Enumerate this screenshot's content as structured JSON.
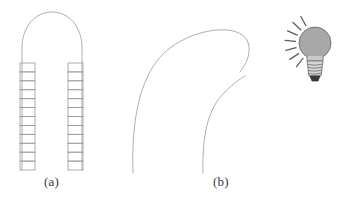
{
  "figure": {
    "background_color": "#ffffff",
    "line_color": "#9a9a9a",
    "line_width": 0.8,
    "captions": [
      {
        "id": "a",
        "label": "(a)",
        "x": 44,
        "y": 174
      },
      {
        "id": "b",
        "label": "(b)",
        "x": 213,
        "y": 174
      }
    ],
    "panels": [
      {
        "id": "panel-a",
        "caption": "(a)",
        "name": "straight-arch-with-ladder-rungs",
        "arch": {
          "name": "arch-outline",
          "left_x": 22,
          "right_x": 82,
          "top_y": 12,
          "bottom_y": 170,
          "shoulder_y": 48,
          "stroke": "#9a9a9a"
        },
        "rung_columns": [
          {
            "name": "left-rung-column",
            "x": 20,
            "width": 15,
            "top_y": 63,
            "bottom_y": 170,
            "segments": 12,
            "stroke": "#9a9a9a"
          },
          {
            "name": "right-rung-column",
            "x": 68,
            "width": 15,
            "top_y": 63,
            "bottom_y": 170,
            "segments": 12,
            "stroke": "#9a9a9a"
          }
        ]
      },
      {
        "id": "panel-b",
        "caption": "(b)",
        "name": "bent-arch-curves",
        "curves": [
          {
            "name": "outer-bent-curve",
            "path": "M 133 173 C 131 120, 140 70, 170 48 C 198 27, 238 24, 247 40 C 252 50, 248 62, 240 72",
            "stroke": "#9a9a9a"
          },
          {
            "name": "inner-bent-curve",
            "path": "M 203 173 C 202 135, 208 108, 225 92 C 234 83, 240 79, 245 76",
            "stroke": "#9a9a9a"
          }
        ]
      }
    ],
    "icons": [
      {
        "id": "light-bulb",
        "name": "light-bulb-icon",
        "bulb": {
          "cx": 315,
          "cy": 43,
          "r": 16,
          "fill": "#a8a8a8",
          "stroke": "#6d6d6d"
        },
        "base": {
          "name": "bulb-screw-base",
          "fill": "#d6d6d6",
          "stroke": "#6d6d6d",
          "thread_count": 4
        },
        "tip": {
          "name": "bulb-contact-tip",
          "fill": "#3a3a3a"
        },
        "rays": {
          "name": "light-rays",
          "count": 7,
          "stroke": "#5d5d5d",
          "side": "left"
        }
      }
    ]
  }
}
